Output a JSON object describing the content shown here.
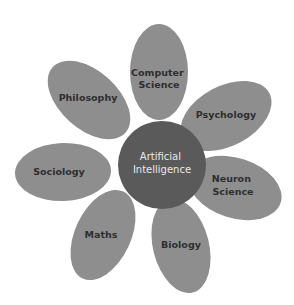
{
  "diagram": {
    "type": "flower",
    "center": {
      "line1": "Artificial",
      "line2": "Intelligence",
      "color": "#5a5a5a"
    },
    "petal_color": "#8e8e8e",
    "petals": [
      {
        "line1": "Computer",
        "line2": "Science"
      },
      {
        "line1": "Psychology",
        "line2": ""
      },
      {
        "line1": "Neuron",
        "line2": "Science"
      },
      {
        "line1": "Biology",
        "line2": ""
      },
      {
        "line1": "Maths",
        "line2": ""
      },
      {
        "line1": "Sociology",
        "line2": ""
      },
      {
        "line1": "Philosophy",
        "line2": ""
      }
    ]
  }
}
